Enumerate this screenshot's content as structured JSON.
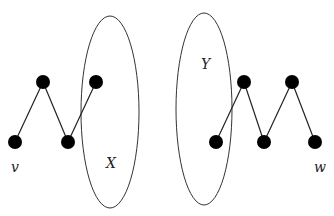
{
  "diagram": {
    "labels": {
      "v": "v",
      "w": "w",
      "X": "X",
      "Y": "Y"
    },
    "sets": [
      {
        "id": "X",
        "cx": 110,
        "cy": 112,
        "rx": 29,
        "ry": 96
      },
      {
        "id": "Y",
        "cx": 204,
        "cy": 109,
        "rx": 28,
        "ry": 96
      }
    ],
    "nodes": [
      {
        "id": "v",
        "x": 15,
        "y": 142
      },
      {
        "id": "a",
        "x": 43,
        "y": 82
      },
      {
        "id": "b",
        "x": 68,
        "y": 142
      },
      {
        "id": "c",
        "x": 96,
        "y": 82
      },
      {
        "id": "d",
        "x": 216,
        "y": 142
      },
      {
        "id": "e",
        "x": 244,
        "y": 82
      },
      {
        "id": "f",
        "x": 264,
        "y": 142
      },
      {
        "id": "g",
        "x": 292,
        "y": 82
      },
      {
        "id": "w",
        "x": 315,
        "y": 142
      }
    ],
    "edges": [
      [
        "v",
        "a"
      ],
      [
        "a",
        "b"
      ],
      [
        "b",
        "c"
      ],
      [
        "d",
        "e"
      ],
      [
        "e",
        "f"
      ],
      [
        "f",
        "g"
      ],
      [
        "g",
        "w"
      ]
    ]
  }
}
